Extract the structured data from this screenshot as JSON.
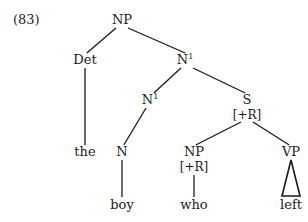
{
  "example_number": "(83)",
  "nodes": {
    "np_root": {
      "label": "NP"
    },
    "det": {
      "label": "Det"
    },
    "n1_upper": {
      "label": "N",
      "sup": "1"
    },
    "n1_lower": {
      "label": "N",
      "sup": "1"
    },
    "s": {
      "label": "S",
      "feature": "[+R]"
    },
    "the": {
      "label": "the"
    },
    "n": {
      "label": "N"
    },
    "np_rel": {
      "label": "NP",
      "feature": "[+R]"
    },
    "vp": {
      "label": "VP"
    },
    "boy": {
      "label": "boy"
    },
    "who": {
      "label": "who"
    },
    "left": {
      "label": "left"
    }
  },
  "edges": [
    [
      "np_root",
      "det"
    ],
    [
      "np_root",
      "n1_upper"
    ],
    [
      "det",
      "the"
    ],
    [
      "n1_upper",
      "n1_lower"
    ],
    [
      "n1_upper",
      "s"
    ],
    [
      "n1_lower",
      "n"
    ],
    [
      "n",
      "boy"
    ],
    [
      "s",
      "np_rel"
    ],
    [
      "s",
      "vp"
    ],
    [
      "np_rel",
      "who"
    ]
  ],
  "triangles": [
    [
      "vp",
      "left"
    ]
  ]
}
